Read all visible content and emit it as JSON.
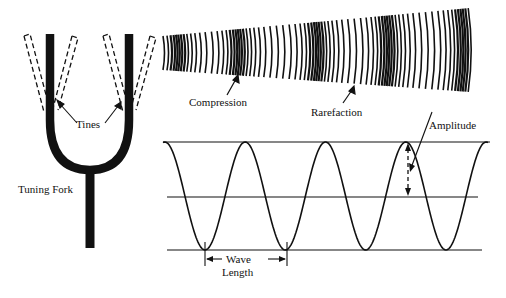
{
  "diagram": {
    "labels": {
      "tines": "Tines",
      "tuning_fork": "Tuning Fork",
      "compression": "Compression",
      "rarefaction": "Rarefaction",
      "amplitude": "Amplitude",
      "wave": "Wave",
      "length": "Length"
    },
    "colors": {
      "ink": "#111111",
      "background": "#ffffff"
    },
    "wave": {
      "baseline_top_y": 142,
      "baseline_mid_y": 197,
      "baseline_bottom_y": 250,
      "trough_x": [
        205,
        287,
        367,
        446
      ],
      "peak_x": [
        245,
        327,
        408
      ]
    }
  }
}
